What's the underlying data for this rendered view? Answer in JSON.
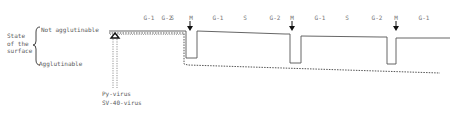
{
  "axis": {
    "title_lines": [
      "State",
      "of the",
      "surface"
    ],
    "top_label": "Not agglutinable",
    "bottom_label": "Agglutinable"
  },
  "phases": [
    {
      "label": "G-1",
      "x": 149
    },
    {
      "label": "S",
      "x": 172
    },
    {
      "label": "G-2",
      "x": 205
    },
    {
      "label": "M",
      "x": 190
    },
    {
      "label": "G-1",
      "x": 219
    },
    {
      "label": "S",
      "x": 245
    },
    {
      "label": "G-2",
      "x": 272
    },
    {
      "label": "M",
      "x": 292
    },
    {
      "label": "G-1",
      "x": 317
    },
    {
      "label": "S",
      "x": 346
    },
    {
      "label": "G-2",
      "x": 378
    },
    {
      "label": "M",
      "x": 396
    },
    {
      "label": "G-1",
      "x": 423
    }
  ],
  "phase_row": [
    "G-1",
    "S",
    "G-2",
    "M",
    "G-1",
    "S",
    "G-2",
    "M",
    "G-1",
    "S",
    "G-2",
    "M",
    "G-1"
  ],
  "infection": {
    "marker": "open-triangle-arrow",
    "labels": [
      "Py-virus",
      "SV-40-virus"
    ]
  },
  "legend": {
    "solid_line": "normal cells",
    "dashed_line": "virus-transformed cells"
  },
  "colors": {
    "line": "#555555",
    "text": "#5a5a5a",
    "background": "#ffffff"
  }
}
